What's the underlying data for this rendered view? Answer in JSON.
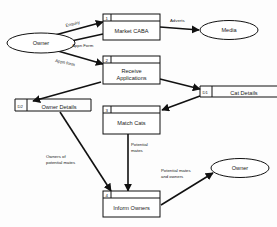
{
  "diagram": {
    "type": "data-flow-diagram",
    "colors": {
      "stroke": "#111111",
      "fill": "#ffffff",
      "text": "#1a1a1a",
      "background": "#fdfdfd"
    },
    "processes": [
      {
        "id": "1",
        "label": "Market CABA"
      },
      {
        "id": "2",
        "label_line1": "Receive",
        "label_line2": "Applications"
      },
      {
        "id": "3",
        "label": "Match Cats"
      },
      {
        "id": "4",
        "label": "Inform Owners"
      }
    ],
    "datastores": [
      {
        "id": "D1",
        "label": "Cat Details"
      },
      {
        "id": "D2",
        "label": "Owner Details"
      }
    ],
    "entities": [
      {
        "name": "entity-owner-left",
        "label": "Owner"
      },
      {
        "name": "entity-media",
        "label": "Media"
      },
      {
        "name": "entity-owner-right",
        "label": "Owner"
      }
    ],
    "flows": [
      {
        "name": "flow-enquiry",
        "label": "Enquiry"
      },
      {
        "name": "flow-adverts",
        "label": "Adverts"
      },
      {
        "name": "flow-appn-form-out",
        "label": "Appn Form"
      },
      {
        "name": "flow-appn-form-in",
        "label": "Appn form"
      },
      {
        "name": "flow-owners-of-potential-mates",
        "label_line1": "Owners of",
        "label_line2": "potential mates"
      },
      {
        "name": "flow-potential-mates",
        "label_line1": "Potential",
        "label_line2": "mates"
      },
      {
        "name": "flow-potential-mates-and-owners",
        "label_line1": "Potential mates",
        "label_line2": "and owners"
      }
    ]
  }
}
